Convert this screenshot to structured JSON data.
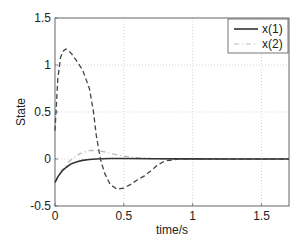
{
  "chart_data": {
    "type": "line",
    "title": "",
    "xlabel": "time/s",
    "ylabel": "State",
    "xlim": [
      0,
      1.7
    ],
    "ylim": [
      -0.5,
      1.5
    ],
    "xticks": [
      0,
      0.5,
      1,
      1.5
    ],
    "xtick_labels": [
      "0",
      "0.5",
      "1",
      "1.5"
    ],
    "yticks": [
      -0.5,
      0,
      0.5,
      1,
      1.5
    ],
    "ytick_labels": [
      "-0.5",
      "0",
      "0.5",
      "1",
      "1.5"
    ],
    "grid": true,
    "legend_position": "upper right",
    "series": [
      {
        "name": "x(1)",
        "style": "solid",
        "color": "#333333",
        "x": [
          0,
          0.02,
          0.05,
          0.08,
          0.12,
          0.16,
          0.2,
          0.25,
          0.3,
          0.4,
          0.5,
          0.7,
          1.0,
          1.3,
          1.7
        ],
        "y": [
          -0.25,
          -0.19,
          -0.13,
          -0.09,
          -0.05,
          -0.03,
          -0.015,
          -0.005,
          0.0,
          0.005,
          0.005,
          0.003,
          0.001,
          0.0,
          0.0
        ]
      },
      {
        "name": "x(2)",
        "style": "dashdot",
        "color": "#bbbbbb",
        "x": [
          0,
          0.05,
          0.1,
          0.15,
          0.2,
          0.25,
          0.3,
          0.35,
          0.4,
          0.5,
          0.6,
          0.7,
          0.8,
          1.0,
          1.3,
          1.7
        ],
        "y": [
          -0.25,
          -0.12,
          -0.03,
          0.03,
          0.07,
          0.09,
          0.09,
          0.08,
          0.06,
          0.03,
          0.015,
          0.005,
          0.0,
          0.0,
          0.0,
          0.0
        ]
      },
      {
        "name": "",
        "style": "dashed",
        "color": "#444444",
        "x": [
          0,
          0.02,
          0.04,
          0.06,
          0.08,
          0.1,
          0.12,
          0.15,
          0.2,
          0.25,
          0.28,
          0.3,
          0.33,
          0.36,
          0.4,
          0.45,
          0.5,
          0.55,
          0.6,
          0.65,
          0.7,
          0.75,
          0.8,
          0.9,
          1.0,
          1.3,
          1.7
        ],
        "y": [
          0.3,
          0.85,
          1.08,
          1.15,
          1.17,
          1.15,
          1.12,
          1.06,
          0.95,
          0.75,
          0.5,
          0.25,
          0.0,
          -0.15,
          -0.27,
          -0.32,
          -0.31,
          -0.27,
          -0.22,
          -0.18,
          -0.12,
          -0.06,
          -0.02,
          0.0,
          0.0,
          0.0,
          0.0
        ]
      }
    ]
  }
}
